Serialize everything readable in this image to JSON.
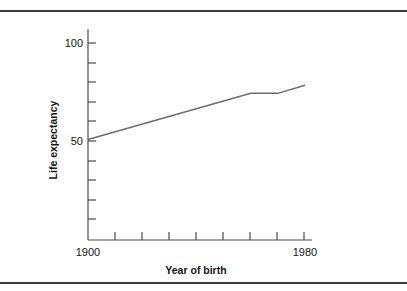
{
  "figure": {
    "has_top_rule": true,
    "has_bottom_rule": true,
    "rule_color": "#3a3a3a",
    "background_color": "#ffffff"
  },
  "chart_data": {
    "type": "line",
    "title": "",
    "subtitle": "",
    "xlabel": "Year of birth",
    "ylabel": "Life expectancy",
    "xlim": [
      1900,
      1980
    ],
    "ylim": [
      0,
      105
    ],
    "grid": false,
    "legend": false,
    "legend_position": "none",
    "x_tick_labels": [
      "1900",
      "1980"
    ],
    "x_labeled_ticks": [
      1900,
      1980
    ],
    "x_minor_ticks": [
      1910,
      1920,
      1930,
      1940,
      1950,
      1960,
      1970
    ],
    "y_tick_labels": [
      "50",
      "100"
    ],
    "y_labeled_ticks": [
      50,
      100
    ],
    "y_minor_ticks": [
      10,
      20,
      30,
      40,
      60,
      70,
      80,
      90
    ],
    "line_color": "#6b6b6b",
    "series": [
      {
        "name": "Life expectancy",
        "x": [
          1900,
          1960,
          1970,
          1980
        ],
        "values": [
          50,
          73,
          73,
          77
        ]
      }
    ]
  },
  "labels": {
    "y_axis_title": "Life expectancy",
    "x_axis_title": "Year of birth",
    "y_top_tick": "100",
    "y_mid_tick": "50",
    "x_left_tick": "1900",
    "x_right_tick": "1980"
  }
}
